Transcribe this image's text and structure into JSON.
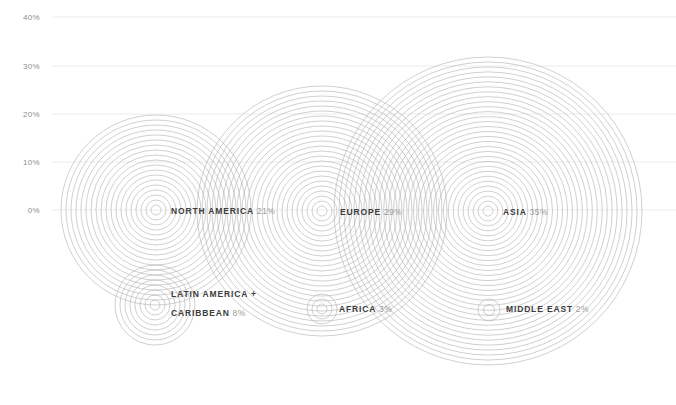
{
  "chart_data": {
    "type": "bubble",
    "title": "",
    "subtitle": "",
    "xlabel": "",
    "ylabel": "",
    "grid": true,
    "legend_position": "inline-labels",
    "ylim": [
      0,
      40
    ],
    "y_ticks": [
      {
        "value": 0,
        "label": "0%",
        "py": 210
      },
      {
        "value": 10,
        "label": "10%",
        "py": 162
      },
      {
        "value": 20,
        "label": "20%",
        "py": 114
      },
      {
        "value": 30,
        "label": "30%",
        "py": 66
      },
      {
        "value": 40,
        "label": "40%",
        "py": 17
      }
    ],
    "categories": [
      "NORTH AMERICA",
      "EUROPE",
      "ASIA",
      "LATIN AMERICA + CARIBBEAN",
      "AFRICA",
      "MIDDLE EAST"
    ],
    "values": [
      21,
      29,
      35,
      8,
      3,
      2
    ],
    "units": "%",
    "ring_color": "#b0b0b0",
    "grid_color": "#ededed",
    "points": [
      {
        "name": "NORTH AMERICA",
        "label_line1": "NORTH AMERICA",
        "label_line2": "",
        "value": 21,
        "value_label": "21%",
        "cx": 156,
        "cy": 210,
        "r": 95,
        "rings": 19,
        "label_x": 171,
        "label_y": 210
      },
      {
        "name": "EUROPE",
        "label_line1": "EUROPE",
        "label_line2": "",
        "value": 29,
        "value_label": "29%",
        "cx": 322,
        "cy": 211,
        "r": 125,
        "rings": 25,
        "label_x": 340,
        "label_y": 211
      },
      {
        "name": "ASIA",
        "label_line1": "ASIA",
        "label_line2": "",
        "value": 35,
        "value_label": "35%",
        "cx": 488,
        "cy": 211,
        "r": 154,
        "rings": 31,
        "label_x": 503,
        "label_y": 211
      },
      {
        "name": "LATIN AMERICA + CARIBBEAN",
        "label_line1": "LATIN AMERICA +",
        "label_line2": "CARIBBEAN",
        "value": 8,
        "value_label": "8%",
        "cx": 155,
        "cy": 305,
        "r": 40,
        "rings": 8,
        "label_x": 171,
        "label_y": 302
      },
      {
        "name": "AFRICA",
        "label_line1": "AFRICA",
        "label_line2": "",
        "value": 3,
        "value_label": "3%",
        "cx": 322,
        "cy": 309,
        "r": 15,
        "rings": 3,
        "label_x": 339,
        "label_y": 308
      },
      {
        "name": "MIDDLE EAST",
        "label_line1": "MIDDLE EAST",
        "label_line2": "",
        "value": 2,
        "value_label": "2%",
        "cx": 489,
        "cy": 310,
        "r": 11,
        "rings": 2,
        "label_x": 506,
        "label_y": 308
      }
    ]
  }
}
